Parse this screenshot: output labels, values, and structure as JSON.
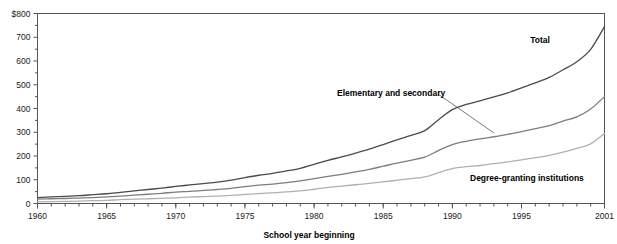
{
  "chart_data": {
    "type": "line",
    "title": "",
    "xlabel": "School year beginning",
    "ylabel": "",
    "xlim": [
      1960,
      2001
    ],
    "ylim": [
      0,
      800
    ],
    "grid": false,
    "legend_position": "inline-annotations",
    "y_tick_labels": [
      "$800",
      "700",
      "600",
      "500",
      "400",
      "300",
      "200",
      "100",
      "0"
    ],
    "y_tick_values": [
      800,
      700,
      600,
      500,
      400,
      300,
      200,
      100,
      0
    ],
    "y_minor_interval": 50,
    "x_tick_labels": [
      "1960",
      "1965",
      "1970",
      "1975",
      "1980",
      "1985",
      "1990",
      "1995",
      "2001"
    ],
    "x_tick_values": [
      1960,
      1965,
      1970,
      1975,
      1980,
      1985,
      1990,
      1995,
      2001
    ],
    "x_minor_interval": 1,
    "x": [
      1960,
      1961,
      1962,
      1963,
      1964,
      1965,
      1966,
      1967,
      1968,
      1969,
      1970,
      1971,
      1972,
      1973,
      1974,
      1975,
      1976,
      1977,
      1978,
      1979,
      1980,
      1981,
      1982,
      1983,
      1984,
      1985,
      1986,
      1987,
      1988,
      1989,
      1990,
      1991,
      1992,
      1993,
      1994,
      1995,
      1996,
      1997,
      1998,
      1999,
      2000,
      2001
    ],
    "series": [
      {
        "name": "Total",
        "color": "#4a4a4a",
        "label": "Total",
        "values": [
          25,
          28,
          30,
          33,
          37,
          41,
          47,
          53,
          59,
          65,
          72,
          78,
          84,
          90,
          98,
          109,
          119,
          127,
          137,
          148,
          165,
          182,
          196,
          212,
          229,
          248,
          268,
          287,
          307,
          353,
          395,
          417,
          432,
          449,
          466,
          487,
          508,
          531,
          563,
          597,
          649,
          745
        ]
      },
      {
        "name": "Elementary and secondary",
        "color": "#7d7d7d",
        "label": "Elementary and secondary",
        "values": [
          18,
          20,
          21,
          23,
          25,
          28,
          31,
          35,
          39,
          43,
          48,
          51,
          55,
          59,
          64,
          71,
          77,
          82,
          88,
          95,
          105,
          114,
          123,
          133,
          144,
          157,
          170,
          182,
          195,
          223,
          248,
          262,
          272,
          281,
          291,
          303,
          315,
          328,
          347,
          365,
          398,
          450
        ]
      },
      {
        "name": "Degree-granting institutions",
        "color": "#b0b0b0",
        "label": "Degree-granting institutions",
        "values": [
          7,
          8,
          9,
          10,
          12,
          13,
          16,
          18,
          20,
          22,
          24,
          27,
          29,
          31,
          34,
          38,
          42,
          45,
          49,
          53,
          60,
          68,
          73,
          79,
          85,
          91,
          98,
          105,
          112,
          130,
          147,
          155,
          160,
          168,
          175,
          184,
          193,
          203,
          216,
          232,
          251,
          295
        ]
      }
    ],
    "annotations": [
      {
        "name": "total-label",
        "text": "Total",
        "x": 540,
        "y": 43,
        "anchor": "middle",
        "leader": null
      },
      {
        "name": "elementary-and-secondary-label",
        "text": "Elementary and secondary",
        "x": 337,
        "y": 96,
        "anchor": "start",
        "leader": {
          "x1": 438,
          "y1": 94,
          "x2": 494,
          "y2": 133
        }
      },
      {
        "name": "degree-granting-institutions-label",
        "text": "Degree-granting institutions",
        "x": 470,
        "y": 181,
        "anchor": "start",
        "leader": null
      }
    ]
  }
}
